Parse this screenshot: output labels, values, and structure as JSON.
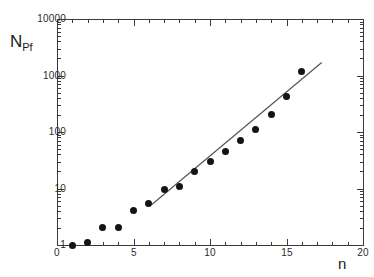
{
  "chart": {
    "title": "",
    "ylabel_main": "N",
    "ylabel_sub": "Pf",
    "xlabel": "n"
  },
  "chart_data": {
    "type": "scatter",
    "title": "",
    "xlabel": "n",
    "ylabel": "N_Pf",
    "xlim": [
      0,
      20
    ],
    "ylim": [
      1,
      10000
    ],
    "yscale": "log",
    "xscale": "linear",
    "grid": false,
    "legend": null,
    "x_ticks": [
      0,
      5,
      10,
      15,
      20
    ],
    "x_tick_labels": [
      "0",
      "5",
      "10",
      "15",
      "20"
    ],
    "x_minor_tick_step": 1,
    "y_ticks": [
      1,
      10,
      100,
      1000,
      10000
    ],
    "y_tick_labels": [
      "1",
      "10",
      "100",
      "1000",
      "10000"
    ],
    "series": [
      {
        "name": "N_Pf data",
        "marker": "filled-circle",
        "color": "#141414",
        "x": [
          1,
          2,
          3,
          4,
          5,
          6,
          7,
          8,
          9,
          10,
          11,
          12,
          13,
          14,
          15,
          16
        ],
        "y": [
          1.0,
          1.1,
          2.0,
          2.0,
          4.0,
          5.5,
          9.5,
          11,
          20,
          30,
          45,
          70,
          110,
          200,
          430,
          1200
        ]
      },
      {
        "name": "power-law fit line",
        "marker": "line",
        "color": "#555555",
        "x": [
          6.2,
          17.3
        ],
        "y": [
          5.2,
          1700
        ]
      }
    ],
    "annotations": []
  }
}
